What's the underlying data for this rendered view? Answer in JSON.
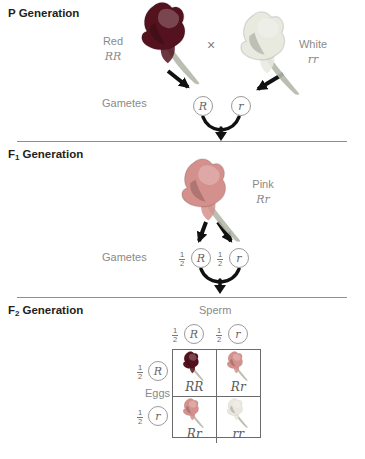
{
  "colors": {
    "red_flower": "#54121f",
    "pink_flower": "#d4908c",
    "white_flower": "#e8eae0",
    "pale_flower": "#eae7de",
    "leaf_gray_green": "#b2b8aa",
    "title_dark": "#231f20",
    "label_gray": "#8a8a8a",
    "genotype_gray": "#5a5a5a",
    "arrow_black": "#111111",
    "divider_gray": "#8f8f8f",
    "circle_border": "#9a9a9a"
  },
  "p_generation": {
    "title_prefix": "P",
    "title_rest": "Generation",
    "parent_left": {
      "phenotype": "Red",
      "genotype": "RR"
    },
    "cross_symbol": "×",
    "parent_right": {
      "phenotype": "White",
      "genotype": "rr"
    },
    "gametes_label": "Gametes",
    "gametes": [
      {
        "allele": "R"
      },
      {
        "allele": "r"
      }
    ]
  },
  "f1_generation": {
    "title_prefix": "F",
    "title_sub": "1",
    "title_rest": "Generation",
    "offspring": {
      "phenotype": "Pink",
      "genotype": "Rr"
    },
    "gametes_label": "Gametes",
    "gametes": [
      {
        "fraction_num": "1",
        "fraction_den": "2",
        "allele": "R"
      },
      {
        "fraction_num": "1",
        "fraction_den": "2",
        "allele": "r"
      }
    ]
  },
  "f2_generation": {
    "title_prefix": "F",
    "title_sub": "2",
    "title_rest": "Generation",
    "sperm_label": "Sperm",
    "eggs_label": "Eggs",
    "sperm_gametes": [
      {
        "fraction_num": "1",
        "fraction_den": "2",
        "allele": "R"
      },
      {
        "fraction_num": "1",
        "fraction_den": "2",
        "allele": "r"
      }
    ],
    "egg_gametes": [
      {
        "fraction_num": "1",
        "fraction_den": "2",
        "allele": "R"
      },
      {
        "fraction_num": "1",
        "fraction_den": "2",
        "allele": "r"
      }
    ],
    "punnett_cells": [
      {
        "genotype": "RR",
        "phenotype": "red"
      },
      {
        "genotype": "Rr",
        "phenotype": "pink"
      },
      {
        "genotype": "Rr",
        "phenotype": "pink"
      },
      {
        "genotype": "rr",
        "phenotype": "white"
      }
    ]
  }
}
